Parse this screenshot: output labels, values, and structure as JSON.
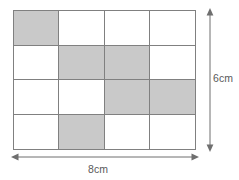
{
  "figure": {
    "grid": {
      "columns": 4,
      "rows": 4,
      "total_cells": 16,
      "shaded_count": 6,
      "unshaded_count": 10,
      "shaded_color": "#c9c9c9",
      "unshaded_color": "#ffffff",
      "line_color": "#808080",
      "cells": [
        [
          {
            "shaded": true
          },
          {
            "shaded": false
          },
          {
            "shaded": false
          },
          {
            "shaded": false
          }
        ],
        [
          {
            "shaded": false
          },
          {
            "shaded": true
          },
          {
            "shaded": true
          },
          {
            "shaded": false
          }
        ],
        [
          {
            "shaded": false
          },
          {
            "shaded": false
          },
          {
            "shaded": true
          },
          {
            "shaded": true
          }
        ],
        [
          {
            "shaded": false
          },
          {
            "shaded": true
          },
          {
            "shaded": false
          },
          {
            "shaded": false
          }
        ]
      ]
    },
    "dimensions": {
      "height_label": "6cm",
      "width_label": "8cm",
      "arrow_color": "#6f6f6f",
      "label_color": "#5a5a5a"
    }
  },
  "chart_data": {
    "type": "table",
    "xlabel": "8cm",
    "ylabel": "6cm",
    "categories": [
      "col1",
      "col2",
      "col3",
      "col4"
    ],
    "rows": [
      "row1",
      "row2",
      "row3",
      "row4"
    ],
    "values": [
      [
        1,
        0,
        0,
        0
      ],
      [
        0,
        1,
        1,
        0
      ],
      [
        0,
        0,
        1,
        1
      ],
      [
        0,
        1,
        0,
        0
      ]
    ],
    "legend": [
      "1 = shaded",
      "0 = unshaded"
    ],
    "annotations": [
      "width 8cm",
      "height 6cm",
      "6 of 16 cells shaded"
    ]
  }
}
